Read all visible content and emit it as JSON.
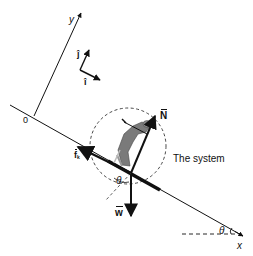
{
  "diagram": {
    "type": "free-body-diagram",
    "axes": {
      "x_label": "x",
      "y_label": "y",
      "origin_label": "0"
    },
    "unit_vectors": {
      "i_label": "î",
      "j_label": "ĵ"
    },
    "forces": [
      {
        "label": "N",
        "name": "normal-force",
        "direction": "perpendicular to incline"
      },
      {
        "label": "w",
        "name": "weight",
        "direction": "straight down"
      },
      {
        "label": "f",
        "subscript": "k",
        "name": "kinetic-friction",
        "direction": "up the incline"
      }
    ],
    "angle_label": "θ",
    "system_label": "The system",
    "colors": {
      "ink": "#111111",
      "figure": "#777777",
      "background": "#ffffff"
    }
  }
}
